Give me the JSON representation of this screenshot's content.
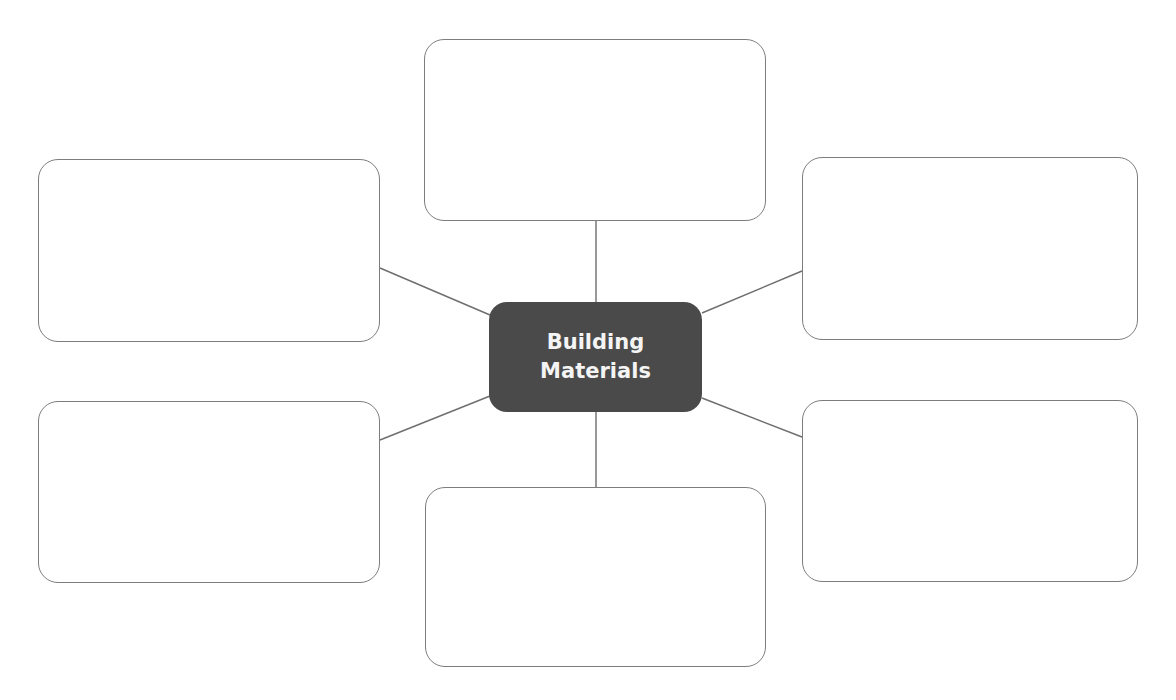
{
  "diagram": {
    "type": "mind-map / concept web",
    "center": {
      "label": "Building\nMaterials",
      "fill": "#4a4a4a",
      "text_color": "#f4f4f4",
      "x": 489,
      "y": 302,
      "w": 213,
      "h": 110
    },
    "stroke_color": "#7d7d7d",
    "line_color": "#6e6e6e",
    "boxes": [
      {
        "id": "top",
        "label": "",
        "x": 424,
        "y": 39,
        "w": 342,
        "h": 182
      },
      {
        "id": "upper-left",
        "label": "",
        "x": 38,
        "y": 159,
        "w": 342,
        "h": 183
      },
      {
        "id": "upper-right",
        "label": "",
        "x": 802,
        "y": 157,
        "w": 336,
        "h": 183
      },
      {
        "id": "lower-left",
        "label": "",
        "x": 38,
        "y": 401,
        "w": 342,
        "h": 182
      },
      {
        "id": "lower-right",
        "label": "",
        "x": 802,
        "y": 400,
        "w": 336,
        "h": 182
      },
      {
        "id": "bottom",
        "label": "",
        "x": 425,
        "y": 487,
        "w": 341,
        "h": 180
      }
    ],
    "connectors": [
      {
        "to": "top",
        "x1": 596,
        "y1": 302,
        "x2": 596,
        "y2": 221
      },
      {
        "to": "upper-left",
        "x1": 490,
        "y1": 315,
        "x2": 380,
        "y2": 268
      },
      {
        "to": "upper-right",
        "x1": 702,
        "y1": 313,
        "x2": 802,
        "y2": 271
      },
      {
        "to": "lower-left",
        "x1": 490,
        "y1": 396,
        "x2": 380,
        "y2": 440
      },
      {
        "to": "lower-right",
        "x1": 702,
        "y1": 398,
        "x2": 802,
        "y2": 437
      },
      {
        "to": "bottom",
        "x1": 596,
        "y1": 412,
        "x2": 596,
        "y2": 487
      }
    ]
  }
}
